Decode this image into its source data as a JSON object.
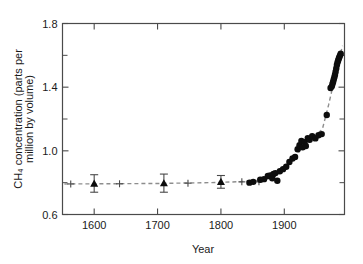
{
  "chart_data": {
    "type": "scatter",
    "title": "",
    "xlabel": "Year",
    "ylabel": "CH₄ concentration (parts per million by volume)",
    "ylabel_line1": "CH₄ concentration (parts per",
    "ylabel_line2": "million by volume)",
    "xlim": [
      1550,
      1995
    ],
    "ylim": [
      0.6,
      1.8
    ],
    "x_ticks": [
      1600,
      1700,
      1800,
      1900
    ],
    "x_tick_labels": [
      "1600",
      "1700",
      "1800",
      "1900"
    ],
    "y_ticks": [
      0.6,
      1.0,
      1.4,
      1.8
    ],
    "y_tick_labels": [
      "0.6",
      "1.0",
      "1.4",
      "1.8"
    ],
    "y_minor_ticks": [
      0.8,
      1.2,
      1.6
    ],
    "grid": false,
    "legend": "none",
    "axis_color": "#4a4a4a",
    "marker_color": "#0d0d0d",
    "trend_color": "#8d8d8d",
    "series": [
      {
        "name": "Ice core (triangles with error bars)",
        "marker": "triangle",
        "points": [
          {
            "x": 1600,
            "y": 0.795,
            "yerr": 0.055
          },
          {
            "x": 1710,
            "y": 0.797,
            "yerr": 0.057
          },
          {
            "x": 1800,
            "y": 0.805,
            "yerr": 0.04
          }
        ]
      },
      {
        "name": "Ice core (cross markers)",
        "marker": "cross",
        "points": [
          {
            "x": 1563,
            "y": 0.792
          },
          {
            "x": 1640,
            "y": 0.793
          },
          {
            "x": 1748,
            "y": 0.797
          },
          {
            "x": 1833,
            "y": 0.805
          },
          {
            "x": 1860,
            "y": 0.805
          }
        ]
      },
      {
        "name": "Ice core and atmospheric measurements",
        "marker": "circle",
        "points": [
          {
            "x": 1845,
            "y": 0.8
          },
          {
            "x": 1851,
            "y": 0.805
          },
          {
            "x": 1862,
            "y": 0.818
          },
          {
            "x": 1868,
            "y": 0.822
          },
          {
            "x": 1874,
            "y": 0.842
          },
          {
            "x": 1878,
            "y": 0.845
          },
          {
            "x": 1881,
            "y": 0.828
          },
          {
            "x": 1883,
            "y": 0.855
          },
          {
            "x": 1886,
            "y": 0.86
          },
          {
            "x": 1889,
            "y": 0.812
          },
          {
            "x": 1893,
            "y": 0.872
          },
          {
            "x": 1898,
            "y": 0.885
          },
          {
            "x": 1903,
            "y": 0.9
          },
          {
            "x": 1908,
            "y": 0.93
          },
          {
            "x": 1913,
            "y": 0.952
          },
          {
            "x": 1917,
            "y": 0.962
          },
          {
            "x": 1921,
            "y": 1.01
          },
          {
            "x": 1924,
            "y": 1.035
          },
          {
            "x": 1927,
            "y": 1.062
          },
          {
            "x": 1929,
            "y": 1.022
          },
          {
            "x": 1932,
            "y": 1.055
          },
          {
            "x": 1934,
            "y": 1.03
          },
          {
            "x": 1937,
            "y": 1.08
          },
          {
            "x": 1940,
            "y": 1.07
          },
          {
            "x": 1944,
            "y": 1.092
          },
          {
            "x": 1949,
            "y": 1.078
          },
          {
            "x": 1954,
            "y": 1.098
          },
          {
            "x": 1959,
            "y": 1.105
          },
          {
            "x": 1967,
            "y": 1.225
          },
          {
            "x": 1973,
            "y": 1.395
          },
          {
            "x": 1975,
            "y": 1.405
          },
          {
            "x": 1976,
            "y": 1.42
          },
          {
            "x": 1977,
            "y": 1.432
          },
          {
            "x": 1978,
            "y": 1.448
          },
          {
            "x": 1979,
            "y": 1.462
          },
          {
            "x": 1980,
            "y": 1.478
          },
          {
            "x": 1981,
            "y": 1.497
          },
          {
            "x": 1982,
            "y": 1.518
          },
          {
            "x": 1983,
            "y": 1.54
          },
          {
            "x": 1984,
            "y": 1.555
          },
          {
            "x": 1985,
            "y": 1.568
          },
          {
            "x": 1986,
            "y": 1.58
          },
          {
            "x": 1987,
            "y": 1.59
          },
          {
            "x": 1988,
            "y": 1.6
          },
          {
            "x": 1989,
            "y": 1.61
          }
        ]
      }
    ],
    "trend_line": {
      "name": "fitted trend",
      "style": "dashed",
      "points": [
        {
          "x": 1553,
          "y": 0.792
        },
        {
          "x": 1620,
          "y": 0.793
        },
        {
          "x": 1700,
          "y": 0.795
        },
        {
          "x": 1780,
          "y": 0.8
        },
        {
          "x": 1830,
          "y": 0.806
        },
        {
          "x": 1860,
          "y": 0.815
        },
        {
          "x": 1880,
          "y": 0.83
        },
        {
          "x": 1900,
          "y": 0.88
        },
        {
          "x": 1915,
          "y": 0.95
        },
        {
          "x": 1930,
          "y": 1.03
        },
        {
          "x": 1945,
          "y": 1.085
        },
        {
          "x": 1960,
          "y": 1.135
        },
        {
          "x": 1970,
          "y": 1.29
        },
        {
          "x": 1978,
          "y": 1.43
        },
        {
          "x": 1985,
          "y": 1.56
        },
        {
          "x": 1992,
          "y": 1.66
        }
      ]
    }
  }
}
